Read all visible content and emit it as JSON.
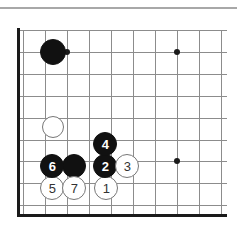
{
  "figure": {
    "type": "go-board-diagram",
    "board_region": "lower-left corner",
    "background_color": "#ffffff",
    "top_rule_color": "#a8a8a8"
  },
  "board": {
    "grid_spacing": 22,
    "line_color": "#8c8c8c",
    "border_color": "#1a1a1a",
    "border_width": 3,
    "x_lines": [
      23,
      45,
      67,
      89,
      111,
      133,
      155,
      177,
      199,
      221
    ],
    "y_lines": [
      30,
      52,
      74,
      96,
      118,
      140,
      161,
      183,
      205
    ],
    "left_border_x": 18,
    "bottom_border_y": 215,
    "star_points": [
      {
        "name": "star-point-upper-left",
        "x": 67,
        "y": 52
      },
      {
        "name": "star-point-upper-right",
        "x": 177,
        "y": 52
      },
      {
        "name": "star-point-lower-right",
        "x": 177,
        "y": 161
      }
    ]
  },
  "stones": [
    {
      "id": "black-corner-stone",
      "color": "black",
      "label": "",
      "x": 53,
      "y": 52,
      "r": 13
    },
    {
      "id": "white-approach-stone",
      "color": "white",
      "label": "",
      "x": 53,
      "y": 127,
      "r": 11
    },
    {
      "id": "black-side-stone",
      "color": "black",
      "label": "",
      "x": 74,
      "y": 166,
      "r": 12
    },
    {
      "id": "move-1",
      "color": "white",
      "label": "1",
      "x": 106,
      "y": 188,
      "r": 12
    },
    {
      "id": "move-2",
      "color": "black",
      "label": "2",
      "x": 105,
      "y": 166,
      "r": 12
    },
    {
      "id": "move-3",
      "color": "white",
      "label": "3",
      "x": 127,
      "y": 166,
      "r": 12
    },
    {
      "id": "move-4",
      "color": "black",
      "label": "4",
      "x": 105,
      "y": 144,
      "r": 12
    },
    {
      "id": "move-5",
      "color": "white",
      "label": "5",
      "x": 52,
      "y": 188,
      "r": 12
    },
    {
      "id": "move-6",
      "color": "black",
      "label": "6",
      "x": 52,
      "y": 166,
      "r": 12
    },
    {
      "id": "move-7",
      "color": "white",
      "label": "7",
      "x": 74,
      "y": 188,
      "r": 12
    }
  ],
  "move_sequence": {
    "count": 7,
    "labels": [
      "1",
      "2",
      "3",
      "4",
      "5",
      "6",
      "7"
    ],
    "black_moves": [
      "2",
      "4",
      "6"
    ],
    "white_moves": [
      "1",
      "3",
      "5",
      "7"
    ]
  },
  "colors": {
    "black_stone": "#111111",
    "white_stone": "#ffffff",
    "white_stone_outline": "#777777",
    "grid_line": "#8c8c8c",
    "board_border": "#1a1a1a",
    "black_label_text": "#ffffff",
    "white_label_text": "#333333"
  }
}
